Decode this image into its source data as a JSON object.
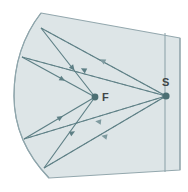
{
  "figure": {
    "name": "concave-mirror-ray-diagram",
    "type": "optics-ray-diagram",
    "width": 188,
    "height": 192,
    "background_color": "#ffffff"
  },
  "colors": {
    "mirror_fill": "#dde5e7",
    "mirror_stroke": "#93a7ad",
    "ray_solid": "#5d7f85",
    "ray_dashed": "#7f9ba0",
    "point_marker": "#4c6f73",
    "label_text": "#3e4547",
    "divider_line": "#8fa6ac"
  },
  "labels": {
    "focal_point": "F",
    "source_point": "S"
  },
  "points": {
    "focal_point": {
      "label": "F",
      "x": 95,
      "y": 97,
      "label_x": 103,
      "label_y": 101
    },
    "source_point": {
      "label": "S",
      "x": 166,
      "y": 96,
      "label_x": 163,
      "label_y": 86
    }
  },
  "geometry": {
    "mirror_body": {
      "description": "concave mirror block outline",
      "path": "M 41,13 L 180,38 L 180,170 L 49,178 C 22,150 14,120 14,96 C 14,64 24,35 41,13 Z"
    },
    "arc_surface": {
      "description": "reflective concave arc on the left",
      "path": "M 41,13 C 24,35 14,64 14,96 C 14,120 22,150 49,178"
    },
    "divider_line": {
      "description": "vertical line left of S",
      "x1": 165,
      "y1": 33,
      "x2": 165,
      "y2": 172
    },
    "right_edge": {
      "x1": 180,
      "y1": 38,
      "x2": 180,
      "y2": 170
    }
  },
  "rays": {
    "solid": [
      {
        "name": "ray-upper-outer-incident",
        "points": [
          [
            41,
            28
          ],
          [
            95,
            97
          ]
        ]
      },
      {
        "name": "ray-upper-outer-reflected",
        "points": [
          [
            41,
            28
          ],
          [
            166,
            96
          ]
        ]
      },
      {
        "name": "ray-upper-inner-incident",
        "points": [
          [
            22,
            57
          ],
          [
            95,
            97
          ]
        ]
      },
      {
        "name": "ray-upper-inner-reflected",
        "points": [
          [
            22,
            57
          ],
          [
            166,
            96
          ]
        ]
      },
      {
        "name": "ray-lower-inner-incident",
        "points": [
          [
            24,
            139
          ],
          [
            95,
            97
          ]
        ]
      },
      {
        "name": "ray-lower-inner-reflected",
        "points": [
          [
            24,
            139
          ],
          [
            166,
            96
          ]
        ]
      },
      {
        "name": "ray-lower-outer-incident",
        "points": [
          [
            44,
            168
          ],
          [
            95,
            97
          ]
        ]
      },
      {
        "name": "ray-lower-outer-reflected",
        "points": [
          [
            44,
            168
          ],
          [
            166,
            96
          ]
        ]
      }
    ],
    "dashed": [
      {
        "name": "dashed-ray-upper-outer",
        "points": [
          [
            166,
            96
          ],
          [
            41,
            28
          ]
        ]
      },
      {
        "name": "dashed-ray-upper-inner",
        "points": [
          [
            166,
            96
          ],
          [
            22,
            57
          ]
        ]
      },
      {
        "name": "dashed-ray-lower-inner",
        "points": [
          [
            166,
            96
          ],
          [
            24,
            139
          ]
        ]
      },
      {
        "name": "dashed-ray-lower-outer",
        "points": [
          [
            166,
            96
          ],
          [
            44,
            168
          ]
        ]
      }
    ],
    "arrow_count": 8
  },
  "arrowheads": [
    {
      "name": "arrowhead-upper-outer-down",
      "x": 70,
      "y": 65,
      "angle": 52
    },
    {
      "name": "arrowhead-upper-inner-right",
      "x": 60,
      "y": 78,
      "angle": 28
    },
    {
      "name": "arrowhead-upper-dashed-left",
      "x": 104,
      "y": 61,
      "angle": 208
    },
    {
      "name": "arrowhead-upper-dashed-left-2",
      "x": 87,
      "y": 70,
      "angle": 208
    },
    {
      "name": "arrowhead-lower-up",
      "x": 60,
      "y": 120,
      "angle": 330
    },
    {
      "name": "arrowhead-lower-up-2",
      "x": 70,
      "y": 134,
      "angle": 332
    },
    {
      "name": "arrowhead-lower-dashed-left",
      "x": 100,
      "y": 122,
      "angle": 186
    },
    {
      "name": "arrowhead-lower-dashed-left-2",
      "x": 105,
      "y": 136,
      "angle": 192
    }
  ]
}
